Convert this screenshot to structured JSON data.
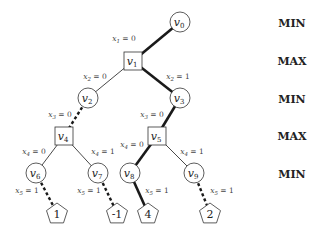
{
  "levels": [
    {
      "label": "MIN",
      "y": 23
    },
    {
      "label": "MAX",
      "y": 61
    },
    {
      "label": "MIN",
      "y": 99
    },
    {
      "label": "MAX",
      "y": 136
    },
    {
      "label": "MIN",
      "y": 174
    }
  ],
  "nodes": [
    {
      "id": "v0",
      "sub": "0",
      "shape": "circle",
      "x": 180,
      "y": 22
    },
    {
      "id": "v1",
      "sub": "1",
      "shape": "square",
      "x": 133,
      "y": 61
    },
    {
      "id": "v2",
      "sub": "2",
      "shape": "circle",
      "x": 88,
      "y": 98
    },
    {
      "id": "v3",
      "sub": "3",
      "shape": "circle",
      "x": 180,
      "y": 98
    },
    {
      "id": "v4",
      "sub": "4",
      "shape": "square",
      "x": 64,
      "y": 136
    },
    {
      "id": "v5",
      "sub": "5",
      "shape": "square",
      "x": 157,
      "y": 136
    },
    {
      "id": "v6",
      "sub": "6",
      "shape": "circle",
      "x": 36,
      "y": 173
    },
    {
      "id": "v7",
      "sub": "7",
      "shape": "circle",
      "x": 98,
      "y": 173
    },
    {
      "id": "v8",
      "sub": "8",
      "shape": "circle",
      "x": 130,
      "y": 173
    },
    {
      "id": "v9",
      "sub": "9",
      "shape": "circle",
      "x": 194,
      "y": 173
    }
  ],
  "leaves": [
    {
      "value": "1",
      "x": 57,
      "y": 213
    },
    {
      "value": "-1",
      "x": 117,
      "y": 213
    },
    {
      "value": "4",
      "x": 148,
      "y": 213
    },
    {
      "value": "2",
      "x": 210,
      "y": 213
    }
  ],
  "edges": [
    {
      "from": "v0",
      "to": "v1",
      "label": "x",
      "sub": "1",
      "val": "0",
      "style": "thick",
      "lx": 124,
      "ly": 41
    },
    {
      "from": "v1",
      "to": "v2",
      "label": "x",
      "sub": "2",
      "val": "0",
      "style": "thin",
      "lx": 95,
      "ly": 79
    },
    {
      "from": "v1",
      "to": "v3",
      "label": "x",
      "sub": "2",
      "val": "1",
      "style": "thick",
      "lx": 178,
      "ly": 79
    },
    {
      "from": "v2",
      "to": "v4",
      "label": "x",
      "sub": "3",
      "val": "0",
      "style": "dashed",
      "lx": 60,
      "ly": 117
    },
    {
      "from": "v3",
      "to": "v5",
      "label": "x",
      "sub": "3",
      "val": "0",
      "style": "thick",
      "lx": 152,
      "ly": 117
    },
    {
      "from": "v4",
      "to": "v6",
      "label": "x",
      "sub": "4",
      "val": "0",
      "style": "thin",
      "lx": 34,
      "ly": 154
    },
    {
      "from": "v4",
      "to": "v7",
      "label": "x",
      "sub": "4",
      "val": "1",
      "style": "thin",
      "lx": 103,
      "ly": 154
    },
    {
      "from": "v5",
      "to": "v8",
      "label": "x",
      "sub": "4",
      "val": "0",
      "style": "thick",
      "lx": 132,
      "ly": 147
    },
    {
      "from": "v5",
      "to": "v9",
      "label": "x",
      "sub": "4",
      "val": "1",
      "style": "thin",
      "lx": 192,
      "ly": 154
    },
    {
      "from": "v6",
      "to": "L0",
      "label": "x",
      "sub": "5",
      "val": "1",
      "style": "dashed",
      "lx": 27,
      "ly": 193
    },
    {
      "from": "v7",
      "to": "L1",
      "label": "x",
      "sub": "5",
      "val": "1",
      "style": "dashed",
      "lx": 89,
      "ly": 193
    },
    {
      "from": "v8",
      "to": "L2",
      "label": "x",
      "sub": "5",
      "val": "1",
      "style": "thick",
      "lx": 157,
      "ly": 193
    },
    {
      "from": "v9",
      "to": "L3",
      "label": "x",
      "sub": "5",
      "val": "1",
      "style": "dashed",
      "lx": 222,
      "ly": 193
    }
  ]
}
